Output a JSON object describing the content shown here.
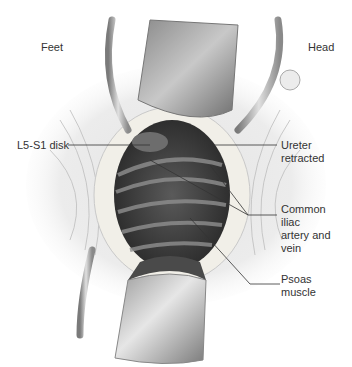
{
  "figure": {
    "orientation": {
      "left": "Feet",
      "right": "Head"
    },
    "labels": [
      {
        "id": "l5s1",
        "lines": [
          "L5-S1 disk"
        ]
      },
      {
        "id": "ureter",
        "lines": [
          "Ureter",
          "retracted"
        ]
      },
      {
        "id": "iliac",
        "lines": [
          "Common",
          "iliac",
          "artery and",
          "vein"
        ]
      },
      {
        "id": "psoas",
        "lines": [
          "Psoas",
          "muscle"
        ]
      }
    ]
  }
}
